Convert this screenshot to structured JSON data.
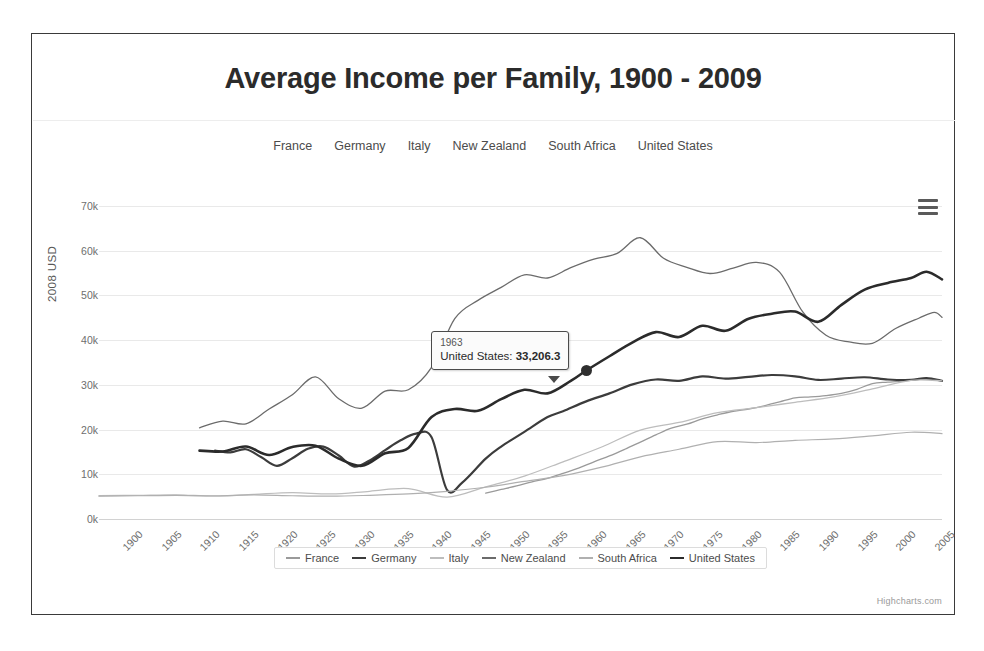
{
  "chart": {
    "title": "Average Income per Family, 1900 - 2009",
    "credits": "Highcharts.com",
    "export_icon": "hamburger-menu-icon"
  },
  "top_legend": {
    "items": [
      {
        "label": "France"
      },
      {
        "label": "Germany"
      },
      {
        "label": "Italy"
      },
      {
        "label": "New Zealand"
      },
      {
        "label": "South Africa"
      },
      {
        "label": "United States"
      }
    ]
  },
  "bottom_legend": {
    "items": [
      {
        "label": "France",
        "color": "#9a9a9a"
      },
      {
        "label": "Germany",
        "color": "#3c3c3c"
      },
      {
        "label": "Italy",
        "color": "#bdbdbd"
      },
      {
        "label": "New Zealand",
        "color": "#6b6b6b"
      },
      {
        "label": "South Africa",
        "color": "#b0b0b0"
      },
      {
        "label": "United States",
        "color": "#2b2b2b"
      }
    ]
  },
  "tooltip": {
    "header": "1963",
    "series_label": "United States:",
    "value": "33,206.3"
  },
  "axes": {
    "y_title": "2008 USD",
    "y_ticks": [
      "0k",
      "10k",
      "20k",
      "30k",
      "40k",
      "50k",
      "60k",
      "70k"
    ],
    "x_ticks": [
      "1900",
      "1905",
      "1910",
      "1915",
      "1920",
      "1925",
      "1930",
      "1935",
      "1940",
      "1945",
      "1950",
      "1955",
      "1960",
      "1965",
      "1970",
      "1975",
      "1980",
      "1985",
      "1990",
      "1995",
      "2000",
      "2005"
    ]
  },
  "chart_data": {
    "type": "line",
    "title": "Average Income per Family, 1900 - 2009",
    "xlabel": "",
    "ylabel": "2008 USD",
    "xlim": [
      1900,
      2009
    ],
    "ylim": [
      0,
      70000
    ],
    "grid": true,
    "legend_position": "bottom",
    "y_tick_values": [
      0,
      10000,
      20000,
      30000,
      40000,
      50000,
      60000,
      70000
    ],
    "x_tick_values": [
      1900,
      1905,
      1910,
      1915,
      1920,
      1925,
      1930,
      1935,
      1940,
      1945,
      1950,
      1955,
      1960,
      1965,
      1970,
      1975,
      1980,
      1985,
      1990,
      1995,
      2000,
      2005
    ],
    "annotations": [
      {
        "x": 1963,
        "y": 33206.3,
        "series": "United States",
        "label": "1963 United States: 33,206.3"
      }
    ],
    "series": [
      {
        "name": "France",
        "color": "#9a9a9a",
        "x": [
          1950,
          1952,
          1954,
          1956,
          1958,
          1960,
          1962,
          1964,
          1966,
          1968,
          1970,
          1972,
          1974,
          1976,
          1978,
          1980,
          1982,
          1984,
          1986,
          1988,
          1990,
          1992,
          1994,
          1996,
          1998,
          2000,
          2002,
          2004,
          2006,
          2008,
          2009
        ],
        "values": [
          5800,
          6600,
          7400,
          8300,
          9100,
          10200,
          11400,
          12800,
          14100,
          15600,
          17200,
          18800,
          20300,
          21200,
          22400,
          23300,
          24100,
          24600,
          25300,
          26200,
          27100,
          27300,
          27600,
          28100,
          29000,
          30300,
          30600,
          30900,
          31300,
          31200,
          30800
        ]
      },
      {
        "name": "Germany",
        "color": "#3c3c3c",
        "x": [
          1915,
          1917,
          1919,
          1921,
          1923,
          1925,
          1927,
          1929,
          1931,
          1933,
          1935,
          1937,
          1939,
          1941,
          1943,
          1945,
          1947,
          1950,
          1952,
          1955,
          1958,
          1960,
          1963,
          1966,
          1969,
          1972,
          1975,
          1978,
          1981,
          1984,
          1987,
          1990,
          1993,
          1996,
          1999,
          2002,
          2005,
          2007,
          2009
        ],
        "values": [
          15300,
          14900,
          15600,
          13800,
          11900,
          13600,
          15700,
          16200,
          14200,
          11700,
          13100,
          15400,
          17600,
          19100,
          18300,
          6500,
          8200,
          13500,
          16200,
          19500,
          22800,
          24100,
          26300,
          28100,
          30100,
          31200,
          30900,
          31900,
          31400,
          31800,
          32200,
          31900,
          31100,
          31400,
          31700,
          31200,
          31100,
          31500,
          30900
        ]
      },
      {
        "name": "Italy",
        "color": "#bdbdbd",
        "x": [
          1900,
          1905,
          1910,
          1915,
          1920,
          1925,
          1930,
          1935,
          1940,
          1945,
          1950,
          1955,
          1960,
          1965,
          1970,
          1975,
          1980,
          1985,
          1990,
          1995,
          2000,
          2005,
          2009
        ],
        "values": [
          5200,
          5300,
          5400,
          5100,
          5500,
          5900,
          5600,
          6200,
          6800,
          4900,
          7200,
          9600,
          12800,
          16100,
          19900,
          21600,
          23800,
          24900,
          26100,
          27300,
          29100,
          31000,
          30900
        ]
      },
      {
        "name": "New Zealand",
        "color": "#6b6b6b",
        "x": [
          1913,
          1916,
          1919,
          1922,
          1925,
          1928,
          1931,
          1934,
          1937,
          1940,
          1943,
          1946,
          1949,
          1952,
          1955,
          1958,
          1961,
          1964,
          1967,
          1970,
          1973,
          1976,
          1979,
          1982,
          1985,
          1988,
          1991,
          1994,
          1997,
          2000,
          2003,
          2006,
          2008,
          2009
        ],
        "values": [
          20400,
          21900,
          21300,
          24600,
          27800,
          31800,
          26900,
          24800,
          28600,
          28900,
          33900,
          44800,
          48900,
          51800,
          54600,
          53900,
          56200,
          58100,
          59400,
          62900,
          58300,
          56300,
          54900,
          56100,
          57400,
          55200,
          46300,
          41100,
          39600,
          39300,
          42600,
          44900,
          46200,
          45100
        ]
      },
      {
        "name": "South Africa",
        "color": "#b0b0b0",
        "x": [
          1900,
          1905,
          1910,
          1915,
          1920,
          1925,
          1930,
          1935,
          1940,
          1945,
          1950,
          1955,
          1960,
          1965,
          1970,
          1975,
          1980,
          1985,
          1990,
          1995,
          2000,
          2005,
          2009
        ],
        "values": [
          5100,
          5200,
          5300,
          5200,
          5400,
          5200,
          5100,
          5300,
          5600,
          6200,
          7100,
          8400,
          9700,
          11600,
          13900,
          15600,
          17300,
          17100,
          17600,
          17900,
          18600,
          19400,
          19100
        ]
      },
      {
        "name": "United States",
        "color": "#2b2b2b",
        "x": [
          1913,
          1916,
          1919,
          1922,
          1925,
          1928,
          1931,
          1934,
          1937,
          1940,
          1943,
          1946,
          1949,
          1952,
          1955,
          1958,
          1961,
          1963,
          1966,
          1969,
          1972,
          1975,
          1978,
          1981,
          1984,
          1987,
          1990,
          1993,
          1996,
          1999,
          2002,
          2005,
          2007,
          2009
        ],
        "values": [
          15300,
          15100,
          16200,
          14300,
          16100,
          16400,
          13500,
          11900,
          14700,
          15900,
          22800,
          24600,
          24200,
          26800,
          28900,
          28100,
          30900,
          33206.3,
          36400,
          39500,
          41800,
          40700,
          43200,
          42100,
          44800,
          45900,
          46400,
          44100,
          47900,
          51300,
          52800,
          53900,
          55300,
          53600
        ]
      }
    ]
  }
}
